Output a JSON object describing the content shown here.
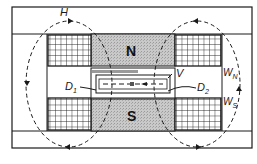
{
  "diagram": {
    "labels": {
      "field": "H",
      "vacuum": "V",
      "dee_left": "D",
      "dee_left_sub": "1",
      "dee_right": "D",
      "dee_right_sub": "2",
      "winding_north": "W",
      "winding_north_sub": "N",
      "winding_south": "W",
      "winding_south_sub": "S",
      "pole_north": "N",
      "pole_south": "S"
    },
    "colors": {
      "line": "#1a1a1a",
      "pole_fill": "#bdbdbd",
      "background": "#ffffff"
    }
  }
}
